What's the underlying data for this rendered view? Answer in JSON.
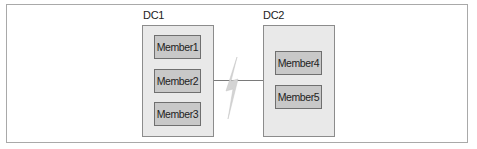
{
  "diagram": {
    "type": "datacenter-topology",
    "datacenters": [
      {
        "label": "DC1",
        "members": [
          "Member1",
          "Member2",
          "Member3"
        ]
      },
      {
        "label": "DC2",
        "members": [
          "Member4",
          "Member5"
        ]
      }
    ],
    "connection": {
      "from": "DC1",
      "to": "DC2",
      "style": "lightning-bolt (network partition)"
    },
    "colors": {
      "frame_border": "#a9a9a9",
      "dc_fill": "#e9e9e9",
      "dc_border": "#8c8c8c",
      "member_fill": "#c8c8c8",
      "member_border": "#6f6f6f",
      "link": "#7a7a7a",
      "bolt": "#cfcfcf"
    }
  }
}
